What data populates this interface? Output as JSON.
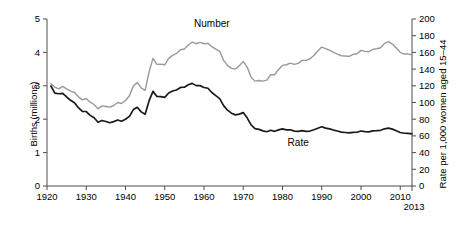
{
  "chart_data": {
    "type": "line",
    "title": "",
    "subtitle": "",
    "xlabel": "",
    "ylabel": "Births (millions)",
    "y2label": "Rate per 1,000 women aged 15–44",
    "grid": false,
    "legend_position": "inline-annotation",
    "xlim": [
      1920,
      2013
    ],
    "ylim": [
      0,
      5
    ],
    "y2lim": [
      0,
      200
    ],
    "xticks": [
      1920,
      1930,
      1940,
      1950,
      1960,
      1970,
      1980,
      1990,
      2000,
      2010
    ],
    "xtick_labels": [
      "1920",
      "1930",
      "1940",
      "1950",
      "1960",
      "1970",
      "1980",
      "1990",
      "2000",
      "2010"
    ],
    "x_end_label": "2013",
    "yticks": [
      0,
      1,
      2,
      3,
      4,
      5
    ],
    "ytick_labels": [
      "0",
      "1",
      "2",
      "3",
      "4",
      "5"
    ],
    "y2ticks": [
      0,
      20,
      40,
      60,
      80,
      100,
      120,
      140,
      160,
      180,
      200
    ],
    "y2tick_labels": [
      "0",
      "20",
      "40",
      "60",
      "80",
      "100",
      "120",
      "140",
      "160",
      "180",
      "200"
    ],
    "annotations": [
      {
        "text": "Number",
        "x": 1962,
        "y_axis": "right",
        "value": 190
      },
      {
        "text": "Rate",
        "x": 1984,
        "y_axis": "right",
        "value": 48
      }
    ],
    "series": [
      {
        "name": "Number",
        "label": "Number",
        "axis": "left",
        "color": "#999999",
        "units": "millions",
        "x": [
          1921,
          1922,
          1923,
          1924,
          1925,
          1926,
          1927,
          1928,
          1929,
          1930,
          1931,
          1932,
          1933,
          1934,
          1935,
          1936,
          1937,
          1938,
          1939,
          1940,
          1941,
          1942,
          1943,
          1944,
          1945,
          1946,
          1947,
          1948,
          1949,
          1950,
          1951,
          1952,
          1953,
          1954,
          1955,
          1956,
          1957,
          1958,
          1959,
          1960,
          1961,
          1962,
          1963,
          1964,
          1965,
          1966,
          1967,
          1968,
          1969,
          1970,
          1971,
          1972,
          1973,
          1974,
          1975,
          1976,
          1977,
          1978,
          1979,
          1980,
          1981,
          1982,
          1983,
          1984,
          1985,
          1986,
          1987,
          1988,
          1989,
          1990,
          1991,
          1992,
          1993,
          1994,
          1995,
          1996,
          1997,
          1998,
          1999,
          2000,
          2001,
          2002,
          2003,
          2004,
          2005,
          2006,
          2007,
          2008,
          2009,
          2010,
          2011,
          2012,
          2013
        ],
        "values": [
          3.06,
          2.96,
          2.91,
          2.98,
          2.91,
          2.84,
          2.8,
          2.67,
          2.58,
          2.62,
          2.51,
          2.44,
          2.31,
          2.4,
          2.38,
          2.36,
          2.41,
          2.5,
          2.47,
          2.56,
          2.7,
          2.99,
          3.1,
          2.94,
          2.86,
          3.41,
          3.82,
          3.64,
          3.65,
          3.63,
          3.82,
          3.91,
          3.97,
          4.08,
          4.1,
          4.22,
          4.31,
          4.26,
          4.3,
          4.26,
          4.27,
          4.17,
          4.1,
          4.03,
          3.76,
          3.61,
          3.52,
          3.5,
          3.6,
          3.73,
          3.56,
          3.26,
          3.14,
          3.16,
          3.14,
          3.17,
          3.33,
          3.33,
          3.49,
          3.61,
          3.63,
          3.68,
          3.64,
          3.67,
          3.76,
          3.76,
          3.81,
          3.91,
          4.04,
          4.16,
          4.11,
          4.07,
          4.0,
          3.95,
          3.9,
          3.89,
          3.88,
          3.94,
          3.96,
          4.06,
          4.03,
          4.02,
          4.09,
          4.11,
          4.14,
          4.27,
          4.32,
          4.25,
          4.13,
          4.0,
          3.95,
          3.95,
          3.93
        ]
      },
      {
        "name": "Rate",
        "label": "Rate",
        "axis": "right",
        "color": "#1a1a1a",
        "units": "per 1,000 women aged 15–44",
        "x": [
          1921,
          1922,
          1923,
          1924,
          1925,
          1926,
          1927,
          1928,
          1929,
          1930,
          1931,
          1932,
          1933,
          1934,
          1935,
          1936,
          1937,
          1938,
          1939,
          1940,
          1941,
          1942,
          1943,
          1944,
          1945,
          1946,
          1947,
          1948,
          1949,
          1950,
          1951,
          1952,
          1953,
          1954,
          1955,
          1956,
          1957,
          1958,
          1959,
          1960,
          1961,
          1962,
          1963,
          1964,
          1965,
          1966,
          1967,
          1968,
          1969,
          1970,
          1971,
          1972,
          1973,
          1974,
          1975,
          1976,
          1977,
          1978,
          1979,
          1980,
          1981,
          1982,
          1983,
          1984,
          1985,
          1986,
          1987,
          1988,
          1989,
          1990,
          1991,
          1992,
          1993,
          1994,
          1995,
          1996,
          1997,
          1998,
          1999,
          2000,
          2001,
          2002,
          2003,
          2004,
          2005,
          2006,
          2007,
          2008,
          2009,
          2010,
          2011,
          2012,
          2013
        ],
        "values": [
          119.8,
          111.2,
          110.5,
          110.9,
          106.6,
          102.6,
          99.8,
          93.8,
          89.3,
          89.2,
          84.6,
          81.7,
          76.3,
          78.5,
          77.2,
          75.8,
          77.1,
          79.1,
          77.6,
          79.9,
          83.4,
          91.5,
          94.3,
          88.8,
          85.9,
          101.9,
          113.3,
          107.3,
          107.1,
          106.2,
          111.4,
          113.8,
          115.0,
          118.0,
          118.3,
          121.2,
          122.9,
          120.2,
          120.2,
          118.0,
          117.1,
          112.0,
          108.3,
          104.7,
          96.3,
          90.8,
          87.2,
          85.2,
          86.1,
          87.9,
          81.6,
          73.1,
          68.8,
          67.8,
          66.0,
          65.0,
          66.8,
          65.5,
          67.2,
          68.4,
          67.3,
          67.3,
          65.7,
          65.5,
          66.3,
          65.4,
          65.8,
          67.3,
          69.2,
          70.9,
          69.3,
          68.4,
          67.0,
          65.9,
          64.6,
          64.1,
          63.6,
          64.3,
          64.4,
          65.9,
          65.1,
          64.8,
          66.1,
          66.3,
          66.7,
          68.5,
          69.3,
          68.1,
          66.2,
          64.1,
          63.2,
          63.0,
          62.5
        ]
      }
    ]
  },
  "axes": {
    "left_title": "Births (millions)",
    "right_title": "Rate per 1,000 women aged 15–44"
  }
}
